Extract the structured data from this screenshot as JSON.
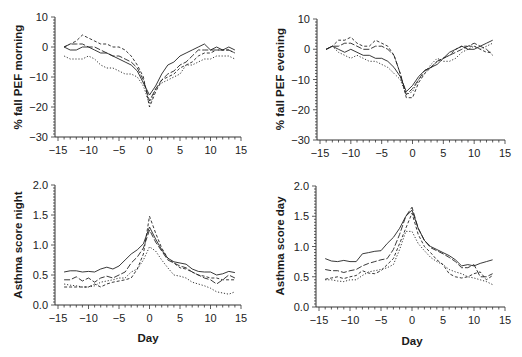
{
  "chart_data": [
    {
      "id": "pef-morning",
      "type": "line",
      "title": "",
      "xlabel": "",
      "ylabel": "% fall PEF morning",
      "xlim": [
        -15,
        15
      ],
      "ylim": [
        -30,
        10
      ],
      "xticks": [
        -15,
        -10,
        -5,
        0,
        5,
        10,
        15
      ],
      "yticks": [
        10,
        0,
        -10,
        -20,
        -30
      ],
      "ytick_labels": [
        "10",
        "0",
        "−10",
        "−20",
        "−30"
      ],
      "xtick_labels": [
        "−15",
        "−10",
        "−5",
        "0",
        "5",
        "10",
        "15"
      ],
      "grid": false,
      "x": [
        -14,
        -13,
        -12,
        -11,
        -10,
        -9,
        -8,
        -7,
        -6,
        -5,
        -4,
        -3,
        -2,
        -1,
        0,
        1,
        2,
        3,
        4,
        5,
        6,
        7,
        8,
        9,
        10,
        11,
        12,
        13,
        14
      ],
      "series": [
        {
          "name": "Series 1 (solid)",
          "style": "solid",
          "values": [
            0,
            -1,
            -1,
            0,
            0,
            -1,
            -2,
            -2,
            -3,
            -4,
            -5,
            -6,
            -8,
            -12,
            -16,
            -13,
            -9,
            -6,
            -5,
            -3,
            -2,
            -1,
            0,
            1,
            -1,
            0,
            -1,
            0,
            -1
          ]
        },
        {
          "name": "Series 2 (long dash)",
          "style": "longdash",
          "values": [
            0,
            1,
            1,
            1,
            0,
            0,
            -1,
            -2,
            -3,
            -3,
            -4,
            -5,
            -7,
            -11,
            -18,
            -14,
            -11,
            -9,
            -8,
            -6,
            -5,
            -3,
            -1,
            -1,
            -1,
            -1,
            -1,
            -1,
            -2
          ]
        },
        {
          "name": "Series 3 (dash)",
          "style": "dash",
          "values": [
            0,
            1,
            2,
            4,
            3,
            2,
            1,
            1,
            0,
            0,
            -1,
            -3,
            -6,
            -10,
            -20,
            -15,
            -11,
            -10,
            -9,
            -7,
            -6,
            -5,
            -3,
            -2,
            -2,
            -1,
            -1,
            -1,
            -2
          ]
        },
        {
          "name": "Series 4 (dotted)",
          "style": "dotted",
          "values": [
            -3,
            -4,
            -4,
            -4,
            -3,
            -4,
            -6,
            -7,
            -7,
            -8,
            -9,
            -9,
            -10,
            -13,
            -19,
            -14,
            -12,
            -11,
            -10,
            -9,
            -6,
            -6,
            -5,
            -4,
            -4,
            -3,
            -3,
            -3,
            -4
          ]
        }
      ]
    },
    {
      "id": "pef-evening",
      "type": "line",
      "title": "",
      "xlabel": "",
      "ylabel": "% fall PEF evening",
      "xlim": [
        -15,
        15
      ],
      "ylim": [
        -30,
        10
      ],
      "xticks": [
        -15,
        -10,
        -5,
        0,
        5,
        10,
        15
      ],
      "yticks": [
        10,
        0,
        -10,
        -20,
        -30
      ],
      "ytick_labels": [
        "10",
        "0",
        "−10",
        "−20",
        "−30"
      ],
      "xtick_labels": [
        "−15",
        "−10",
        "−5",
        "0",
        "5",
        "10",
        "15"
      ],
      "grid": false,
      "x": [
        -14,
        -13,
        -12,
        -11,
        -10,
        -9,
        -8,
        -7,
        -6,
        -5,
        -4,
        -3,
        -2,
        -1,
        0,
        1,
        2,
        3,
        4,
        5,
        6,
        7,
        8,
        9,
        10,
        11,
        12,
        13
      ],
      "series": [
        {
          "name": "Series 1 (solid)",
          "style": "solid",
          "values": [
            0,
            1,
            0,
            -1,
            0,
            -1,
            -2,
            -2,
            -3,
            -3,
            -4,
            -6,
            -9,
            -14,
            -12,
            -9,
            -7,
            -6,
            -5,
            -3,
            -1,
            0,
            1,
            0,
            0,
            1,
            2,
            3
          ]
        },
        {
          "name": "Series 2 (long dash)",
          "style": "longdash",
          "values": [
            0,
            1,
            1,
            2,
            2,
            1,
            0,
            0,
            1,
            1,
            0,
            -2,
            -8,
            -15,
            -13,
            -10,
            -7,
            -6,
            -4,
            -3,
            -2,
            -1,
            0,
            1,
            2,
            1,
            0,
            -2
          ]
        },
        {
          "name": "Series 3 (dash)",
          "style": "dash",
          "values": [
            0,
            1,
            3,
            3,
            4,
            2,
            1,
            1,
            3,
            2,
            1,
            -2,
            -8,
            -16,
            -16,
            -11,
            -8,
            -6,
            -4,
            -3,
            -2,
            0,
            1,
            1,
            1,
            0,
            -1,
            -1
          ]
        },
        {
          "name": "Series 4 (dotted)",
          "style": "dotted",
          "values": [
            0,
            1,
            -1,
            -2,
            -3,
            -2,
            -3,
            -4,
            -4,
            -5,
            -6,
            -8,
            -10,
            -15,
            -14,
            -10,
            -8,
            -5,
            -3,
            -4,
            -4,
            -3,
            -1,
            0,
            1,
            0,
            1,
            2
          ]
        }
      ]
    },
    {
      "id": "asthma-night",
      "type": "line",
      "title": "",
      "xlabel": "Day",
      "ylabel": "Asthma score night",
      "xlim": [
        -15,
        15
      ],
      "ylim": [
        0.0,
        2.0
      ],
      "xticks": [
        -15,
        -10,
        -5,
        0,
        5,
        10,
        15
      ],
      "yticks": [
        2.0,
        1.5,
        1.0,
        0.5,
        0.0
      ],
      "ytick_labels": [
        "2.0",
        "1.5",
        "1.0",
        "0.5",
        "0.0"
      ],
      "xtick_labels": [
        "−15",
        "−10",
        "−5",
        "0",
        "5",
        "10",
        "15"
      ],
      "grid": false,
      "x": [
        -14,
        -13,
        -12,
        -11,
        -10,
        -9,
        -8,
        -7,
        -6,
        -5,
        -4,
        -3,
        -2,
        -1,
        0,
        1,
        2,
        3,
        4,
        5,
        6,
        7,
        8,
        9,
        10,
        11,
        12,
        13,
        14
      ],
      "series": [
        {
          "name": "Series 1 (solid)",
          "style": "solid",
          "values": [
            0.55,
            0.57,
            0.57,
            0.55,
            0.56,
            0.55,
            0.6,
            0.63,
            0.6,
            0.65,
            0.75,
            0.85,
            0.92,
            1.02,
            1.3,
            1.1,
            0.92,
            0.78,
            0.72,
            0.7,
            0.68,
            0.6,
            0.56,
            0.55,
            0.55,
            0.5,
            0.52,
            0.56,
            0.54
          ]
        },
        {
          "name": "Series 2 (long dash)",
          "style": "longdash",
          "values": [
            0.42,
            0.42,
            0.47,
            0.4,
            0.45,
            0.38,
            0.45,
            0.48,
            0.45,
            0.5,
            0.55,
            0.7,
            0.8,
            0.95,
            1.25,
            1.05,
            0.9,
            0.75,
            0.7,
            0.65,
            0.62,
            0.55,
            0.5,
            0.45,
            0.42,
            0.35,
            0.42,
            0.5,
            0.45
          ]
        },
        {
          "name": "Series 3 (dash)",
          "style": "dash",
          "values": [
            0.3,
            0.3,
            0.3,
            0.3,
            0.3,
            0.35,
            0.3,
            0.35,
            0.38,
            0.4,
            0.42,
            0.45,
            0.6,
            0.85,
            1.48,
            1.2,
            0.95,
            0.78,
            0.7,
            0.62,
            0.6,
            0.55,
            0.5,
            0.48,
            0.45,
            0.45,
            0.42,
            0.42,
            0.42
          ]
        },
        {
          "name": "Series 4 (dotted)",
          "style": "dotted",
          "values": [
            0.35,
            0.33,
            0.32,
            0.3,
            0.3,
            0.32,
            0.38,
            0.4,
            0.42,
            0.45,
            0.45,
            0.55,
            0.6,
            0.75,
            0.97,
            0.9,
            0.75,
            0.62,
            0.5,
            0.48,
            0.45,
            0.38,
            0.35,
            0.32,
            0.28,
            0.22,
            0.2,
            0.18,
            0.22
          ]
        }
      ]
    },
    {
      "id": "asthma-day",
      "type": "line",
      "title": "",
      "xlabel": "Day",
      "ylabel": "Asthma score day",
      "xlim": [
        -15,
        15
      ],
      "ylim": [
        0.0,
        2.0
      ],
      "xticks": [
        -15,
        -10,
        -5,
        0,
        5,
        10,
        15
      ],
      "yticks": [
        2.0,
        1.5,
        1.0,
        0.5,
        0.0
      ],
      "ytick_labels": [
        "2.0",
        "1.5",
        "1.0",
        "0.5",
        "0.0"
      ],
      "xtick_labels": [
        "−15",
        "−10",
        "−5",
        "0",
        "5",
        "10",
        "15"
      ],
      "grid": false,
      "x": [
        -14,
        -13,
        -12,
        -11,
        -10,
        -9,
        -8,
        -7,
        -6,
        -5,
        -4,
        -3,
        -2,
        -1,
        0,
        1,
        2,
        3,
        4,
        5,
        6,
        7,
        8,
        9,
        10,
        11,
        12,
        13
      ],
      "series": [
        {
          "name": "Series 1 (solid)",
          "style": "solid",
          "values": [
            0.8,
            0.76,
            0.75,
            0.77,
            0.75,
            0.75,
            0.88,
            0.9,
            0.92,
            0.93,
            1.05,
            1.15,
            1.3,
            1.5,
            1.6,
            1.3,
            1.1,
            1.0,
            0.95,
            0.9,
            0.85,
            0.78,
            0.68,
            0.7,
            0.68,
            0.72,
            0.75,
            0.78
          ]
        },
        {
          "name": "Series 2 (long dash)",
          "style": "longdash",
          "values": [
            0.62,
            0.6,
            0.6,
            0.57,
            0.6,
            0.62,
            0.68,
            0.72,
            0.75,
            0.78,
            0.8,
            0.95,
            1.2,
            1.5,
            1.65,
            1.3,
            1.1,
            0.98,
            0.93,
            0.88,
            0.82,
            0.75,
            0.65,
            0.65,
            0.7,
            0.5,
            0.5,
            0.55
          ]
        },
        {
          "name": "Series 3 (dash)",
          "style": "dash",
          "values": [
            0.46,
            0.48,
            0.5,
            0.47,
            0.5,
            0.52,
            0.6,
            0.56,
            0.55,
            0.6,
            0.7,
            0.8,
            1.05,
            1.3,
            1.55,
            1.2,
            1.0,
            0.9,
            0.78,
            0.7,
            0.55,
            0.5,
            0.48,
            0.5,
            0.55,
            0.58,
            0.45,
            0.52
          ]
        },
        {
          "name": "Series 4 (dotted)",
          "style": "dotted",
          "values": [
            0.45,
            0.45,
            0.43,
            0.42,
            0.45,
            0.45,
            0.52,
            0.58,
            0.6,
            0.62,
            0.65,
            0.7,
            0.95,
            1.25,
            1.25,
            1.05,
            0.93,
            0.82,
            0.75,
            0.7,
            0.62,
            0.58,
            0.55,
            0.5,
            0.48,
            0.45,
            0.42,
            0.37
          ]
        }
      ]
    }
  ],
  "panels_layout": {
    "rows": 2,
    "cols": 2
  },
  "colors": {
    "line": "#222222",
    "axis": "#333333",
    "background": "#ffffff"
  }
}
